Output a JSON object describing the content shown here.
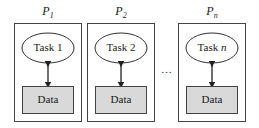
{
  "diagram": {
    "processors": [
      {
        "label": "P",
        "subscript": "1",
        "task_prefix": "Task",
        "task_index": "1",
        "task_index_italic": false,
        "data": "Data"
      },
      {
        "label": "P",
        "subscript": "2",
        "task_prefix": "Task",
        "task_index": "2",
        "task_index_italic": false,
        "data": "Data"
      },
      {
        "label": "P",
        "subscript": "n",
        "task_prefix": "Task",
        "task_index": "n",
        "task_index_italic": true,
        "data": "Data"
      }
    ],
    "ellipsis": "…",
    "colors": {
      "stroke": "#333333",
      "data_fill": "#d9d9d9",
      "background": "#ffffff"
    }
  }
}
